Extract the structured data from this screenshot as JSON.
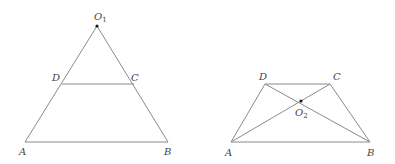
{
  "figures": [
    {
      "name": "triangle-with-parallel-segment",
      "points": {
        "O1": {
          "label": "O",
          "sub": "1",
          "x": 97,
          "y": 26,
          "lx": 94,
          "ly": 20
        },
        "D": {
          "label": "D",
          "x": 62,
          "y": 84,
          "lx": 52,
          "ly": 81
        },
        "C": {
          "label": "C",
          "x": 134,
          "y": 84,
          "lx": 131,
          "ly": 81
        },
        "A": {
          "label": "A",
          "x": 25,
          "y": 142,
          "lx": 19,
          "ly": 155
        },
        "B": {
          "label": "B",
          "x": 168,
          "y": 142,
          "lx": 164,
          "ly": 155
        }
      },
      "segments": [
        [
          "O1",
          "A"
        ],
        [
          "O1",
          "B"
        ],
        [
          "A",
          "B"
        ],
        [
          "D",
          "C"
        ]
      ]
    },
    {
      "name": "trapezoid-with-diagonals",
      "points": {
        "D": {
          "label": "D",
          "x": 265,
          "y": 84,
          "lx": 259,
          "ly": 80
        },
        "C": {
          "label": "C",
          "x": 330,
          "y": 84,
          "lx": 333,
          "ly": 80
        },
        "A": {
          "label": "A",
          "x": 231,
          "y": 142,
          "lx": 225,
          "ly": 156
        },
        "B": {
          "label": "B",
          "x": 370,
          "y": 142,
          "lx": 367,
          "ly": 156
        },
        "O2": {
          "label": "O",
          "sub": "2",
          "x": 301,
          "y": 103,
          "lx": 296,
          "ly": 118
        }
      },
      "segments": [
        [
          "D",
          "C"
        ],
        [
          "A",
          "B"
        ],
        [
          "A",
          "D"
        ],
        [
          "B",
          "C"
        ],
        [
          "A",
          "C"
        ],
        [
          "B",
          "D"
        ]
      ]
    }
  ],
  "labels": {
    "left": {
      "O1": "O",
      "O1_sub": "1",
      "D": "D",
      "C": "C",
      "A": "A",
      "B": "B"
    },
    "right": {
      "D": "D",
      "C": "C",
      "A": "A",
      "B": "B",
      "O2": "O",
      "O2_sub": "2"
    }
  }
}
